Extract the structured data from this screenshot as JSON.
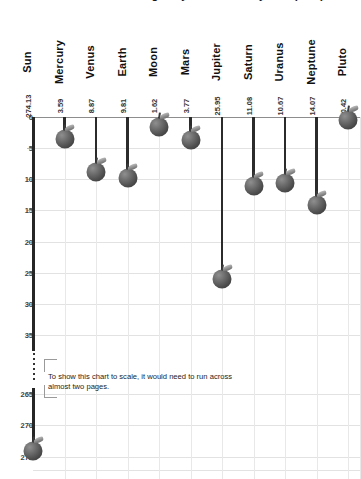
{
  "chart_data": {
    "type": "bar",
    "title": "Surface gravity of the solar system (m/s²)",
    "xlabel": "",
    "ylabel": "",
    "categories": [
      "Sun",
      "Mercury",
      "Venus",
      "Earth",
      "Moon",
      "Mars",
      "Jupiter",
      "Saturn",
      "Uranus",
      "Neptune",
      "Pluto"
    ],
    "values": [
      274.13,
      3.59,
      8.87,
      9.81,
      1.62,
      3.77,
      25.95,
      11.08,
      10.67,
      14.07,
      0.42
    ],
    "value_labels": [
      "274.13",
      "3.59",
      "8.87",
      "9.81",
      "1.62",
      "3.77",
      "25.95",
      "11.08",
      "10.67",
      "14.07",
      "0.42"
    ],
    "yticks_upper": [
      "0",
      "5",
      "10",
      "15",
      "20",
      "25",
      "30",
      "35"
    ],
    "yticks_lower": [
      "265",
      "270",
      "275"
    ],
    "ylim_upper": [
      0,
      37
    ],
    "ylim_lower": [
      263,
      277
    ],
    "axis_break": true,
    "grid": true,
    "legend": "none",
    "marker_style": "apple",
    "annotation": "To show this chart to scale, it would need to run across almost two pages.",
    "annotation_line_1": "To show this chart to scale, it would need to run across",
    "annotation_line_2": "almost two pages."
  },
  "colors": {
    "marker": "#4e4e4e",
    "stem": "#2b2b2b",
    "axis": "#262626",
    "grid": "#e2e2e2",
    "zero_line": "#8d8d8d",
    "text": "#111111",
    "background": "#ffffff"
  }
}
